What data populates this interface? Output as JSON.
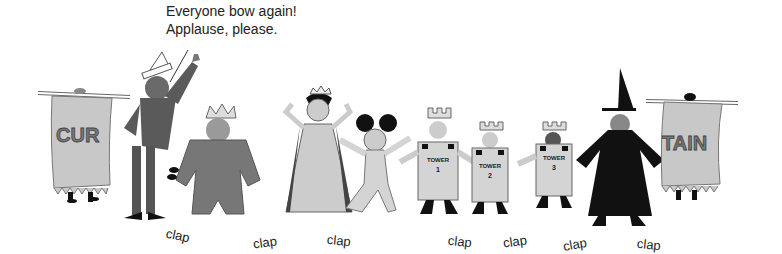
{
  "caption": {
    "line1": "Everyone bow again!",
    "line2": "Applause, please."
  },
  "banners": {
    "left": "CUR",
    "right": "TAIN"
  },
  "towers": [
    {
      "label": "TOWER",
      "number": "1"
    },
    {
      "label": "TOWER",
      "number": "2"
    },
    {
      "label": "TOWER",
      "number": "3"
    }
  ],
  "claps": [
    {
      "text": "clap",
      "x": 166,
      "y": 228,
      "rot": 12
    },
    {
      "text": "clap",
      "x": 253,
      "y": 235,
      "rot": -8
    },
    {
      "text": "clap",
      "x": 327,
      "y": 233,
      "rot": 6
    },
    {
      "text": "clap",
      "x": 448,
      "y": 234,
      "rot": 6
    },
    {
      "text": "clap",
      "x": 503,
      "y": 234,
      "rot": -8
    },
    {
      "text": "clap",
      "x": 563,
      "y": 237,
      "rot": -10
    },
    {
      "text": "clap",
      "x": 637,
      "y": 237,
      "rot": 6
    }
  ],
  "colors": {
    "ink": "#1a1a1a",
    "dark_gray": "#5a5a5a",
    "mid_gray": "#8a8a8a",
    "light_gray": "#c8c8c8",
    "paper": "#e0e0e0"
  }
}
